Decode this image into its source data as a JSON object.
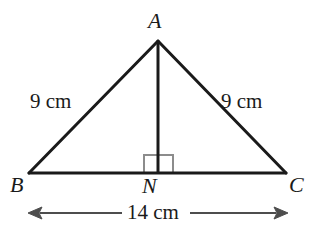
{
  "figure": {
    "background_color": "#ffffff",
    "stroke_color": "#1a1a1a",
    "marker_color": "#8c8c8c",
    "vertices": {
      "A": {
        "label": "A",
        "x": 158,
        "y": 41
      },
      "B": {
        "label": "B",
        "x": 29,
        "y": 173
      },
      "C": {
        "label": "C",
        "x": 286,
        "y": 173
      },
      "N": {
        "label": "N",
        "x": 158,
        "y": 173
      }
    },
    "segments": [
      {
        "name": "AB",
        "from": "A",
        "to": "B"
      },
      {
        "name": "AC",
        "from": "A",
        "to": "C"
      },
      {
        "name": "BC",
        "from": "B",
        "to": "C"
      },
      {
        "name": "AN",
        "from": "A",
        "to": "N"
      }
    ],
    "right_angle": {
      "at": "N",
      "size": 18
    },
    "measurements": {
      "left_side": "9 cm",
      "right_side": "9 cm",
      "base": "14 cm"
    },
    "dimension_line": {
      "y": 213,
      "x_start": 28,
      "x_end": 288,
      "arrowheads": "both"
    }
  }
}
